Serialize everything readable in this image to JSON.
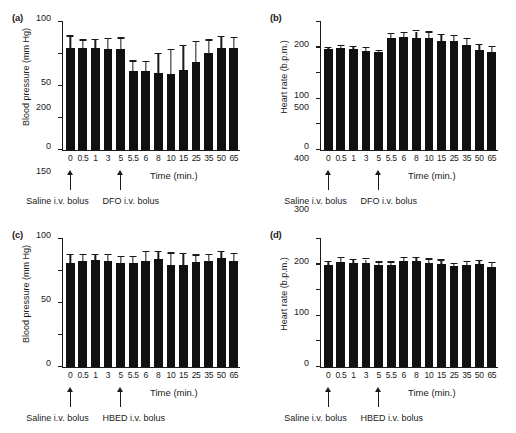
{
  "figure": {
    "panel_count": 4,
    "background": "#ffffff",
    "bar_color": "#111111",
    "axis_color": "#1a1a1a"
  },
  "chart_data": [
    {
      "type": "bar",
      "panel": "(a)",
      "title": "",
      "xlabel": "Time (min.)",
      "ylabel": "Blood pressure (mm Hg)",
      "ylim": [
        0,
        200
      ],
      "yticks": [
        0,
        50,
        100,
        150,
        200
      ],
      "grid": false,
      "legend": "none",
      "categories": [
        "0",
        "0.5",
        "1",
        "3",
        "5",
        "5.5",
        "6",
        "8",
        "10",
        "15",
        "25",
        "35",
        "50",
        "65"
      ],
      "values": [
        159,
        160,
        160,
        158,
        158,
        124,
        124,
        121,
        118,
        125,
        137,
        151,
        160,
        159
      ],
      "errors": [
        18,
        11,
        12,
        15,
        16,
        14,
        13,
        29,
        38,
        37,
        32,
        20,
        16,
        16
      ],
      "annotations": [
        {
          "label": "Saline i.v. bolus",
          "at_category": "0"
        },
        {
          "label": "DFO i.v. bolus",
          "at_category": "5"
        }
      ]
    },
    {
      "type": "bar",
      "panel": "(b)",
      "title": "",
      "xlabel": "Time (min.)",
      "ylabel": "Heart rate (b.p.m.)",
      "ylim": [
        0,
        500
      ],
      "yticks": [
        0,
        100,
        200,
        300,
        400,
        500
      ],
      "grid": false,
      "legend": "none",
      "categories": [
        "0",
        "0.5",
        "1",
        "3",
        "5",
        "5.5",
        "6",
        "8",
        "10",
        "15",
        "25",
        "35",
        "50",
        "65"
      ],
      "values": [
        393,
        398,
        396,
        388,
        381,
        436,
        441,
        437,
        439,
        426,
        424,
        409,
        391,
        383
      ],
      "errors": [
        4,
        8,
        7,
        10,
        6,
        16,
        16,
        26,
        20,
        22,
        20,
        23,
        20,
        19
      ],
      "annotations": [
        {
          "label": "Saline i.v. bolus",
          "at_category": "0"
        },
        {
          "label": "DFO i.v. bolus",
          "at_category": "5"
        }
      ]
    },
    {
      "type": "bar",
      "panel": "(c)",
      "title": "",
      "xlabel": "Time (min.)",
      "ylabel": "Blood pressure (mm Hg)",
      "ylim": [
        0,
        200
      ],
      "yticks": [
        0,
        50,
        100,
        150,
        200
      ],
      "grid": false,
      "legend": "none",
      "categories": [
        "0",
        "0.5",
        "1",
        "3",
        "5",
        "5.5",
        "6",
        "8",
        "10",
        "15",
        "25",
        "35",
        "50",
        "65"
      ],
      "values": [
        163,
        165,
        167,
        165,
        163,
        163,
        166,
        168,
        160,
        159,
        164,
        165,
        170,
        166
      ],
      "errors": [
        12,
        10,
        8,
        10,
        9,
        9,
        13,
        12,
        17,
        17,
        10,
        10,
        10,
        10
      ],
      "annotations": [
        {
          "label": "Saline i.v. bolus",
          "at_category": "0"
        },
        {
          "label": "HBED i.v. bolus",
          "at_category": "5"
        }
      ]
    },
    {
      "type": "bar",
      "panel": "(d)",
      "title": "",
      "xlabel": "Time (min.)",
      "ylabel": "Heart rate (b.p.m.)",
      "ylim": [
        0,
        500
      ],
      "yticks": [
        0,
        100,
        200,
        300,
        400,
        500
      ],
      "grid": false,
      "legend": "none",
      "categories": [
        "0",
        "0.5",
        "1",
        "3",
        "5",
        "5.5",
        "6",
        "8",
        "10",
        "15",
        "25",
        "35",
        "50",
        "65"
      ],
      "values": [
        397,
        412,
        406,
        408,
        399,
        399,
        416,
        416,
        406,
        402,
        393,
        398,
        403,
        390
      ],
      "errors": [
        13,
        14,
        12,
        12,
        9,
        9,
        10,
        10,
        13,
        14,
        10,
        13,
        10,
        17
      ],
      "annotations": [
        {
          "label": "Saline i.v. bolus",
          "at_category": "0"
        },
        {
          "label": "HBED i.v. bolus",
          "at_category": "5"
        }
      ]
    }
  ]
}
